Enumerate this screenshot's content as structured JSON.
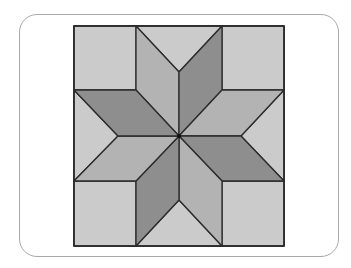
{
  "figure": {
    "colors": {
      "light": "#cbcbcb",
      "medium": "#b3b3b3",
      "dark": "#8e8e8e",
      "stroke": "#2b2b2b",
      "card_border": "#a8a8a8"
    },
    "pieces": {
      "corner_squares": 4,
      "edge_triangles": 4,
      "diamonds": 8
    }
  }
}
